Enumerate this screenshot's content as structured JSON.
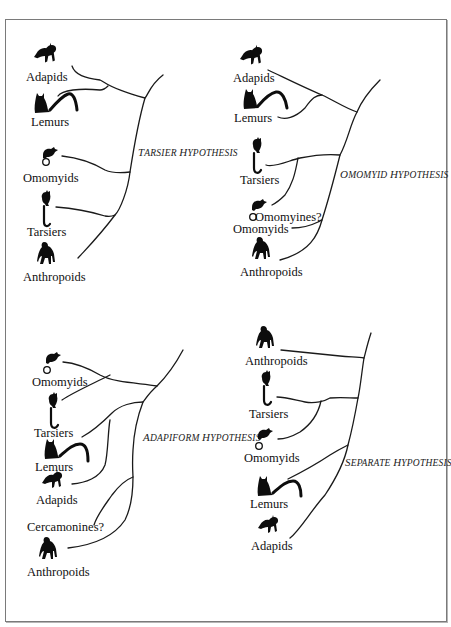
{
  "figure": {
    "panels": [
      {
        "id": "tarsier",
        "title": {
          "prefix_cap": "T",
          "rest": "ARSIER ",
          "prefix_cap2": "H",
          "rest2": "YPOTHESIS",
          "full": "Tarsier Hypothesis"
        },
        "taxa": [
          "Adapids",
          "Lemurs",
          "Omomyids",
          "Tarsiers",
          "Anthropoids"
        ]
      },
      {
        "id": "omomyid",
        "title": {
          "prefix_cap": "O",
          "rest": "MOMYID ",
          "prefix_cap2": "H",
          "rest2": "YPOTHESIS",
          "full": "Omomyid Hypothesis"
        },
        "taxa": [
          "Adapids",
          "Lemurs",
          "Tarsiers",
          "Omomyids",
          "Anthropoids"
        ],
        "annotation": "Omomyines?"
      },
      {
        "id": "adapiform",
        "title": {
          "prefix_cap": "A",
          "rest": "DAPIFORM ",
          "prefix_cap2": "H",
          "rest2": "YPOTHESIS",
          "full": "Adapiform Hypothesis"
        },
        "taxa": [
          "Omomyids",
          "Tarsiers",
          "Lemurs",
          "Adapids",
          "Anthropoids"
        ],
        "annotation": "Cercamonines?"
      },
      {
        "id": "separate",
        "title": {
          "prefix_cap": "S",
          "rest": "EPARATE ",
          "prefix_cap2": "H",
          "rest2": "YPOTHESIS",
          "full": "Separate Hypothesis"
        },
        "taxa": [
          "Anthropoids",
          "Tarsiers",
          "Omomyids",
          "Lemurs",
          "Adapids"
        ]
      }
    ],
    "icons": {
      "adapid": "adapid-silhouette-icon",
      "lemur": "lemur-silhouette-icon",
      "omomyid": "omomyid-silhouette-icon",
      "tarsier": "tarsier-silhouette-icon",
      "anthropoid": "anthropoid-silhouette-icon"
    },
    "colors": {
      "line": "#1a1a1a",
      "frame": "#7a7a7a",
      "background": "#ffffff"
    }
  }
}
